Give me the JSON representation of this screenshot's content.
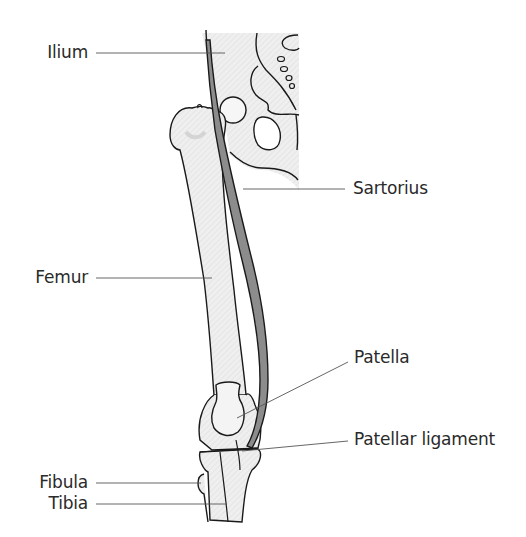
{
  "diagram": {
    "colors": {
      "bone_fill": "#ececec",
      "bone_outline": "#1a1a1a",
      "muscle_fill": "#8c8c8c",
      "leader_line": "#555555",
      "label_text": "#2a2a2a"
    },
    "labels": {
      "ilium": "Ilium",
      "sartorius": "Sartorius",
      "femur": "Femur",
      "patella": "Patella",
      "patellar_ligament": "Patellar ligament",
      "fibula": "Fibula",
      "tibia": "Tibia"
    }
  }
}
